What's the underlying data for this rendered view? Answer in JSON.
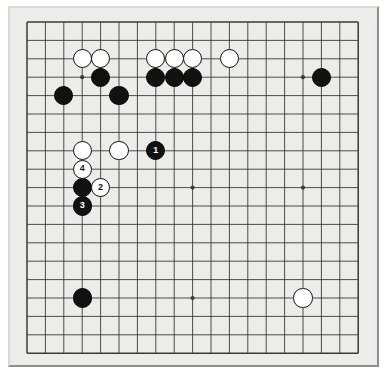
{
  "figure": {
    "kind": "go-board-diagram",
    "board_size": 19,
    "background_color": "#ffffff",
    "board_color": "#ececea",
    "frame_color": "#ececeb",
    "line_color": "#3a3a3a",
    "black_stone_color": "#111111",
    "white_stone_color": "#ffffff"
  },
  "chart_data": {
    "type": "table",
    "title": "",
    "board_size": 19,
    "origin_px": [
      27,
      22
    ],
    "spacing_px": 18.4,
    "star_points": [
      [
        3,
        3
      ],
      [
        9,
        3
      ],
      [
        15,
        3
      ],
      [
        3,
        9
      ],
      [
        9,
        9
      ],
      [
        15,
        9
      ],
      [
        3,
        15
      ],
      [
        9,
        15
      ],
      [
        15,
        15
      ]
    ],
    "stones": [
      {
        "color": "white",
        "col": 3,
        "row": 2,
        "label": ""
      },
      {
        "color": "white",
        "col": 4,
        "row": 2,
        "label": ""
      },
      {
        "color": "white",
        "col": 7,
        "row": 2,
        "label": ""
      },
      {
        "color": "white",
        "col": 8,
        "row": 2,
        "label": ""
      },
      {
        "color": "white",
        "col": 9,
        "row": 2,
        "label": ""
      },
      {
        "color": "white",
        "col": 11,
        "row": 2,
        "label": ""
      },
      {
        "color": "black",
        "col": 4,
        "row": 3,
        "label": ""
      },
      {
        "color": "black",
        "col": 7,
        "row": 3,
        "label": ""
      },
      {
        "color": "black",
        "col": 8,
        "row": 3,
        "label": ""
      },
      {
        "color": "black",
        "col": 9,
        "row": 3,
        "label": ""
      },
      {
        "color": "black",
        "col": 16,
        "row": 3,
        "label": ""
      },
      {
        "color": "black",
        "col": 2,
        "row": 4,
        "label": ""
      },
      {
        "color": "black",
        "col": 5,
        "row": 4,
        "label": ""
      },
      {
        "color": "white",
        "col": 3,
        "row": 7,
        "label": ""
      },
      {
        "color": "white",
        "col": 5,
        "row": 7,
        "label": ""
      },
      {
        "color": "black",
        "col": 7,
        "row": 7,
        "label": "1"
      },
      {
        "color": "white",
        "col": 3,
        "row": 8,
        "label": "4"
      },
      {
        "color": "black",
        "col": 3,
        "row": 9,
        "label": ""
      },
      {
        "color": "white",
        "col": 4,
        "row": 9,
        "label": "2"
      },
      {
        "color": "black",
        "col": 3,
        "row": 10,
        "label": "3"
      },
      {
        "color": "black",
        "col": 3,
        "row": 15,
        "label": ""
      },
      {
        "color": "white",
        "col": 15,
        "row": 15,
        "label": ""
      }
    ],
    "move_labels": [
      "1",
      "2",
      "3",
      "4"
    ],
    "move_sequence": [
      {
        "number": "1",
        "color": "black",
        "col": 7,
        "row": 7
      },
      {
        "number": "2",
        "color": "white",
        "col": 4,
        "row": 9
      },
      {
        "number": "3",
        "color": "black",
        "col": 3,
        "row": 10
      },
      {
        "number": "4",
        "color": "white",
        "col": 3,
        "row": 8
      }
    ]
  }
}
